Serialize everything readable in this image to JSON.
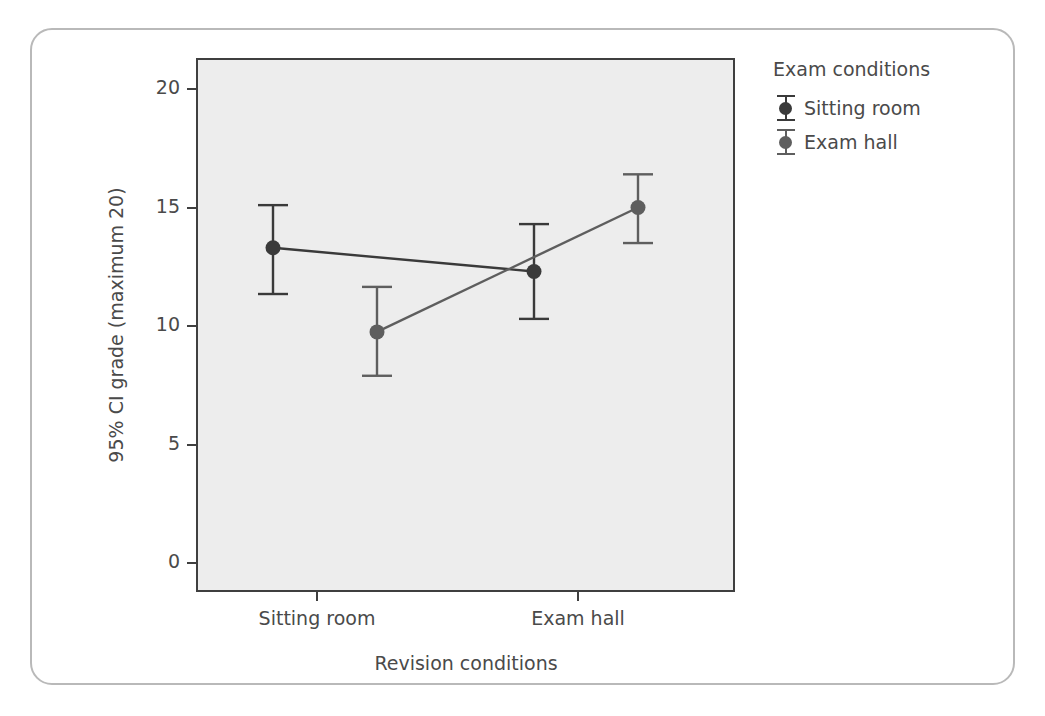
{
  "chart_data": {
    "type": "line",
    "title": "",
    "xlabel": "Revision conditions",
    "ylabel": "95% CI grade (maximum 20)",
    "categories": [
      "Sitting room",
      "Exam hall"
    ],
    "ylim": [
      0,
      21.3
    ],
    "yticks": [
      0,
      5,
      10,
      15,
      20
    ],
    "ytick_labels": [
      "0",
      "5",
      "10",
      "15",
      "20"
    ],
    "grid": false,
    "legend_position": "right",
    "legend_title": "Exam conditions",
    "error_bars": "95% CI",
    "series": [
      {
        "name": "Sitting room",
        "color": "#3a3a3a",
        "values": [
          13.3,
          12.3
        ],
        "ci_low": [
          11.35,
          10.3
        ],
        "ci_high": [
          15.1,
          14.3
        ]
      },
      {
        "name": "Exam hall",
        "color": "#5e5e5e",
        "values": [
          9.75,
          15.0
        ],
        "ci_low": [
          7.9,
          13.5
        ],
        "ci_high": [
          11.65,
          16.4
        ]
      }
    ]
  },
  "figure": {
    "panel_background": "#ededed",
    "panel_border_color": "#3f3f3f",
    "frame_border_color": "#b9b9b9",
    "axis_text_color": "#4a4a4a"
  }
}
